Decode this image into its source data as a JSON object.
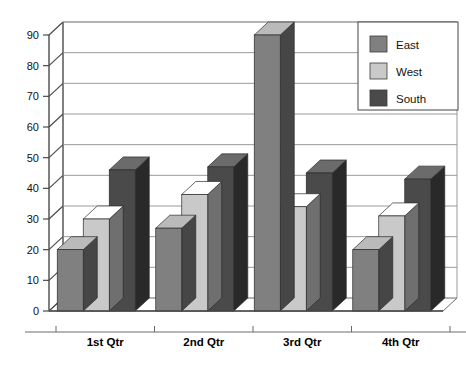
{
  "chart_data": {
    "type": "bar",
    "title": "",
    "subtitle": "",
    "xlabel": "",
    "ylabel": "",
    "categories": [
      "1st Qtr",
      "2nd Qtr",
      "3rd Qtr",
      "4th Qtr"
    ],
    "series": [
      {
        "name": "East",
        "values": [
          20,
          27,
          90,
          20
        ],
        "color": "#808080"
      },
      {
        "name": "West",
        "values": [
          30,
          38,
          34,
          31
        ],
        "color": "#c9c9c9"
      },
      {
        "name": "South",
        "values": [
          46,
          47,
          45,
          43
        ],
        "color": "#4a4a4a"
      }
    ],
    "ylim": [
      0,
      90
    ],
    "yticks": [
      0,
      10,
      20,
      30,
      40,
      50,
      60,
      70,
      80,
      90
    ],
    "ytick_labels": [
      "0",
      "10",
      "20",
      "30",
      "40",
      "50",
      "60",
      "70",
      "80",
      "90"
    ],
    "grid": true,
    "grid_axis": "y",
    "legend_position": "top-right",
    "style": "3d-column",
    "plot_background": "#ffffff",
    "gridline_color": "#9a9a9a",
    "axis_color": "#4a4a4a"
  },
  "legend": {
    "entries": [
      {
        "label": "East",
        "color": "#808080"
      },
      {
        "label": "West",
        "color": "#c9c9c9"
      },
      {
        "label": "South",
        "color": "#4a4a4a"
      }
    ]
  },
  "axes": {
    "y_tick_labels": [
      "90",
      "80",
      "70",
      "60",
      "50",
      "40",
      "30",
      "20",
      "10",
      "0"
    ],
    "x_tick_labels": [
      "1st Qtr",
      "2nd Qtr",
      "3rd Qtr",
      "4th Qtr"
    ]
  }
}
